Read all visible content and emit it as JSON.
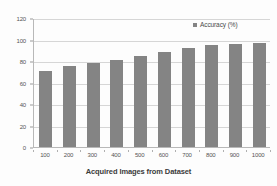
{
  "chart_data": {
    "type": "bar",
    "title": "",
    "xlabel": "Acquired Images from Dataset",
    "ylabel": "",
    "categories": [
      "100",
      "200",
      "300",
      "400",
      "500",
      "600",
      "700",
      "800",
      "900",
      "1000"
    ],
    "series": [
      {
        "name": "Accuracy (%)",
        "values": [
          71,
          75,
          78,
          81,
          85,
          88,
          92,
          95,
          96,
          97
        ]
      }
    ],
    "ylim": [
      0,
      120
    ],
    "yticks": [
      0,
      20,
      40,
      60,
      80,
      100,
      120
    ],
    "ytick_labels": [
      "0",
      "20",
      "40",
      "60",
      "80",
      "100",
      "120"
    ],
    "grid": true,
    "grid_axis": "y",
    "legend": {
      "position": "top-right",
      "entries": [
        {
          "label": "Accuracy (%)",
          "color": "#848484",
          "marker": "square"
        }
      ]
    },
    "colors": {
      "bar": "#848484",
      "gridline": "#d6d6d6",
      "axis": "#b8b8b8",
      "background": "#fdfdfd",
      "tick_text": "#555555",
      "axis_title_text": "#3b3b3b"
    }
  }
}
